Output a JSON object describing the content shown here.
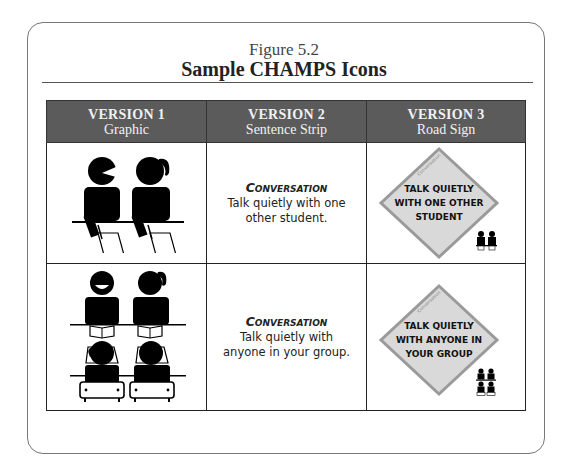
{
  "figure": {
    "label": "Figure 5.2",
    "title": "Sample CHAMPS Icons"
  },
  "table": {
    "headers": [
      {
        "version": "VERSION 1",
        "subtitle": "Graphic"
      },
      {
        "version": "VERSION 2",
        "subtitle": "Sentence Strip"
      },
      {
        "version": "VERSION 3",
        "subtitle": "Road Sign"
      }
    ],
    "rows": [
      {
        "graphic_icon": "two-students-talking-icon",
        "strip_heading": "Conversation",
        "strip_text": "Talk quietly with one other student.",
        "strip_lines": [
          "Talk quietly with one",
          "other student."
        ],
        "sign_label": "Conversation",
        "sign_lines": [
          "TALK QUIETLY",
          "WITH ONE OTHER",
          "STUDENT"
        ],
        "sign_icon": "two-students-icon"
      },
      {
        "graphic_icon": "group-of-students-icon",
        "strip_heading": "Conversation",
        "strip_text": "Talk quietly with anyone in your group.",
        "strip_lines": [
          "Talk quietly with",
          "anyone in your group."
        ],
        "sign_label": "Conversation",
        "sign_lines": [
          "TALK QUIETLY",
          "WITH ANYONE IN",
          "YOUR GROUP"
        ],
        "sign_icon": "four-students-icon"
      }
    ]
  },
  "colors": {
    "header_bg": "#5b5b5b",
    "header_text": "#f2f2f2",
    "sign_fill": "#d9d9d9",
    "sign_border": "#9a9a9a"
  }
}
